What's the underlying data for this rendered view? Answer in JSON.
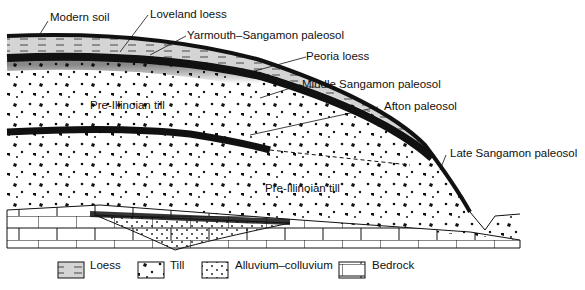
{
  "diagram": {
    "type": "geologic-cross-section",
    "labels": {
      "modern_soil": "Modern soil",
      "loveland_loess": "Loveland loess",
      "yarmouth_sangamon": "Yarmouth–Sangamon paleosol",
      "peoria_loess": "Peoria loess",
      "middle_sangamon": "Middle Sangamon paleosol",
      "afton": "Afton paleosol",
      "pre_illinoian_till_upper": "Pre-Illinoian till",
      "late_sangamon": "Late Sangamon paleosol",
      "pre_illinoian_till_lower": "Pre-Illinoian till"
    },
    "legend": [
      {
        "key": "loess",
        "label": "Loess"
      },
      {
        "key": "till",
        "label": "Till"
      },
      {
        "key": "alluvium",
        "label": "Alluvium–colluvium"
      },
      {
        "key": "bedrock",
        "label": "Bedrock"
      }
    ],
    "colors": {
      "ink": "#111111",
      "paper": "#ffffff",
      "loess_fill": "#d9d9d9"
    }
  }
}
